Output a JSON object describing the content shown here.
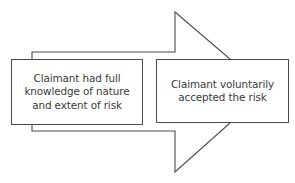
{
  "diagram": {
    "type": "process-arrow",
    "arrow": {
      "direction": "right",
      "stroke_color": "#4a4a4a",
      "fill_color": "#ffffff"
    },
    "boxes": [
      {
        "id": "condition-1",
        "lines": [
          "Claimant had full",
          "knowledge of nature",
          "and extent of risk"
        ]
      },
      {
        "id": "condition-2",
        "lines": [
          "Claimant voluntarily",
          "accepted the risk"
        ]
      }
    ],
    "colors": {
      "text": "#3a3a3a",
      "border": "#4a4a4a",
      "background": "#ffffff"
    }
  }
}
